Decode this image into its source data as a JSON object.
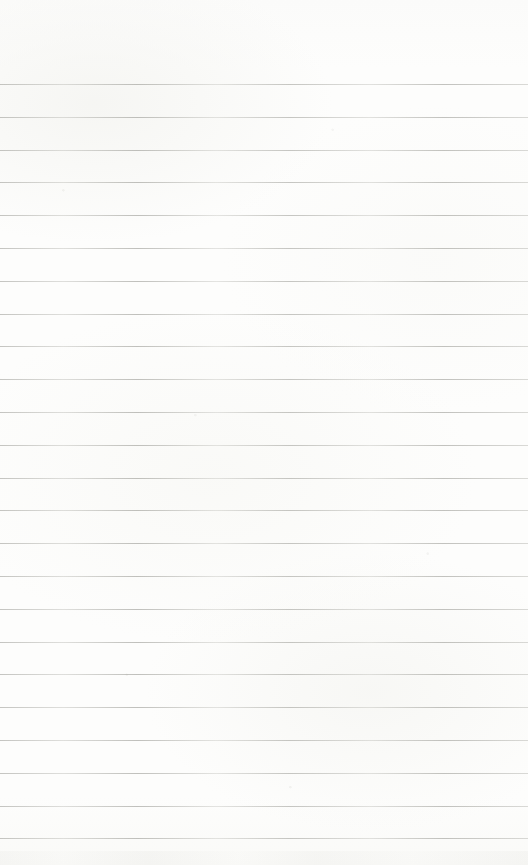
{
  "page": {
    "colors": {
      "paper": "#fcfcfb",
      "rule_line": "#9a9a94"
    },
    "ruled_lines": {
      "count": 24
    }
  }
}
